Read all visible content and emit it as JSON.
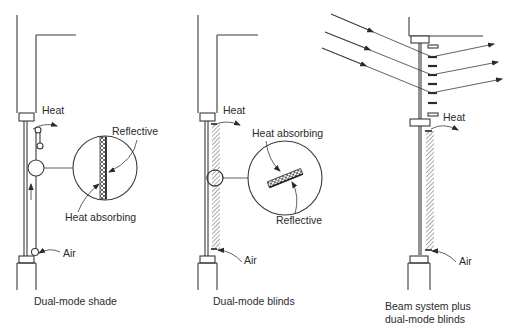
{
  "panels": [
    {
      "id": "dual-mode-shade",
      "caption": "Dual-mode shade",
      "labels": {
        "heat": "Heat",
        "air": "Air",
        "reflective": "Reflective",
        "heat_absorbing": "Heat absorbing"
      }
    },
    {
      "id": "dual-mode-blinds",
      "caption": "Dual-mode blinds",
      "labels": {
        "heat": "Heat",
        "air": "Air",
        "heat_absorbing": "Heat absorbing",
        "reflective": "Reflective"
      }
    },
    {
      "id": "beam-system",
      "caption_line1": "Beam system plus",
      "caption_line2": "dual-mode blinds",
      "labels": {
        "heat": "Heat",
        "air": "Air"
      }
    }
  ],
  "colors": {
    "line": "#3a3a3a",
    "text": "#2a2a2a",
    "background": "#ffffff"
  }
}
